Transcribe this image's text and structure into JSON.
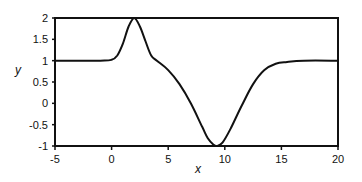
{
  "chart_data": {
    "type": "line",
    "title": "",
    "xlabel": "x",
    "ylabel": "y",
    "xlim": [
      -5,
      20
    ],
    "ylim": [
      -1,
      2
    ],
    "grid": false,
    "legend": null,
    "x_ticks": [
      -5,
      0,
      5,
      10,
      15,
      20
    ],
    "x_tick_labels": [
      "-5",
      "0",
      "5",
      "10",
      "15",
      "20"
    ],
    "y_ticks": [
      2,
      1.5,
      1,
      0.5,
      0,
      -0.5,
      -1
    ],
    "y_tick_labels": [
      "2",
      "1.5",
      "1",
      "0.5",
      "0",
      "-0.5",
      "-1"
    ],
    "series": [
      {
        "name": "y",
        "color": "#111111",
        "x": [
          -5,
          -1,
          0,
          0.5,
          1,
          1.5,
          2,
          2.5,
          3,
          3.5,
          4,
          5,
          6,
          7,
          8,
          8.5,
          9,
          9.3,
          9.8,
          10.5,
          11.5,
          12.5,
          13.5,
          14.5,
          15.5,
          17,
          20
        ],
        "y": [
          1.0,
          1.0,
          1.02,
          1.12,
          1.4,
          1.8,
          2.0,
          1.8,
          1.45,
          1.12,
          1.0,
          0.78,
          0.45,
          0.0,
          -0.55,
          -0.82,
          -0.97,
          -1.0,
          -0.92,
          -0.6,
          -0.05,
          0.45,
          0.78,
          0.93,
          0.97,
          1.0,
          1.0
        ]
      }
    ]
  },
  "axes": {
    "x_label": "x",
    "y_label": "y"
  }
}
